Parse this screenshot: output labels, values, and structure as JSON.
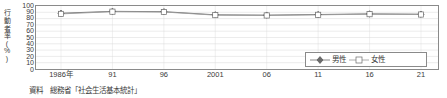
{
  "chart_data": {
    "type": "line",
    "title": "",
    "xlabel": "",
    "ylabel": "行動者率(%)",
    "ylim": [
      0,
      100
    ],
    "ytick_step": 10,
    "grid": true,
    "legend_position": "inside-right",
    "categories": [
      "1986年",
      "91",
      "96",
      "2001",
      "06",
      "11",
      "16",
      "21"
    ],
    "yticks": [
      "100",
      "90",
      "80",
      "70",
      "60",
      "50",
      "40",
      "30",
      "20",
      "10",
      "0"
    ],
    "series": [
      {
        "name": "男性",
        "marker": "filled-diamond",
        "color": "#6b6b6b",
        "values": [
          88.5,
          91.5,
          91.0,
          86.0,
          85.5,
          86.5,
          87.5,
          87.0
        ]
      },
      {
        "name": "女性",
        "marker": "open-square",
        "color": "#9a9a9a",
        "values": [
          87.5,
          91.0,
          90.5,
          85.5,
          85.0,
          86.0,
          87.0,
          86.5
        ]
      }
    ]
  },
  "axis": {
    "y_label_chars": [
      "行",
      "動",
      "者",
      "率",
      "(",
      "%",
      ")"
    ]
  },
  "source": {
    "note": "資料　総務省「社会生活基本統計」"
  },
  "legend": {
    "items": [
      {
        "label": "男性",
        "marker": "filled-diamond"
      },
      {
        "label": "女性",
        "marker": "open-square"
      }
    ]
  },
  "colors": {
    "axis": "#8a8a8a",
    "grid": "#d9d9d9",
    "male": "#6b6b6b",
    "female": "#9a9a9a",
    "text": "#3a3a3a"
  }
}
